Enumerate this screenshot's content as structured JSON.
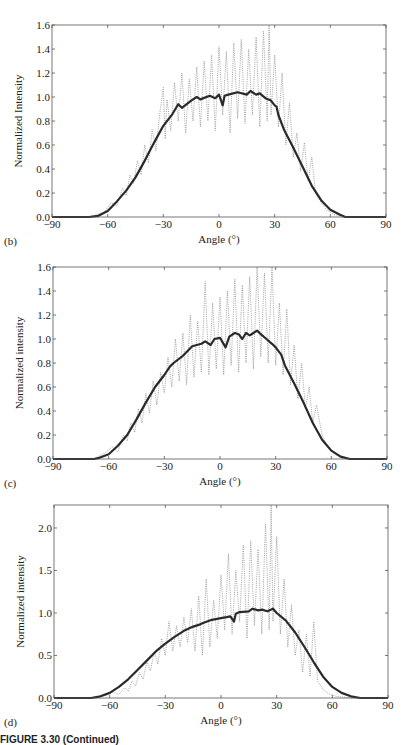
{
  "caption": "FIGURE 3.30  (Continued)",
  "chart_data": [
    {
      "type": "line",
      "panel_label": "(b)",
      "xlabel": "Angle (°)",
      "ylabel": "Normalized Intensity",
      "xlim": [
        -90,
        90
      ],
      "ylim": [
        0,
        1.6
      ],
      "xticks": [
        -90,
        -60,
        -30,
        0,
        30,
        60,
        90
      ],
      "yticks": [
        0.0,
        0.2,
        0.4,
        0.6,
        0.8,
        1.0,
        1.2,
        1.4,
        1.6
      ],
      "ytick_labels": [
        "0.0",
        "0.2",
        "0.4",
        "0.6",
        "0.8",
        "1.0",
        "1.2",
        "1.4",
        "1.6"
      ],
      "grid": false,
      "frame": {
        "left": 52,
        "top": 25,
        "right": 386,
        "bottom": 217
      },
      "series": [
        {
          "name": "smoothed",
          "style": "solid-thick",
          "x": [
            -90,
            -70,
            -65,
            -60,
            -55,
            -50,
            -45,
            -40,
            -35,
            -30,
            -25,
            -22,
            -20,
            -15,
            -12,
            -10,
            -5,
            -2,
            0,
            2,
            3,
            5,
            10,
            15,
            17,
            20,
            22,
            25,
            28,
            30,
            31,
            32,
            35,
            40,
            45,
            50,
            55,
            60,
            65,
            68,
            70,
            90
          ],
          "y": [
            0.0,
            0.0,
            0.01,
            0.05,
            0.13,
            0.22,
            0.33,
            0.47,
            0.62,
            0.76,
            0.86,
            0.94,
            0.91,
            0.97,
            1.0,
            0.98,
            1.01,
            0.99,
            1.02,
            0.93,
            1.01,
            1.02,
            1.04,
            1.02,
            1.05,
            1.02,
            1.03,
            0.99,
            0.97,
            0.93,
            0.92,
            0.85,
            0.73,
            0.58,
            0.42,
            0.26,
            0.14,
            0.06,
            0.02,
            0.0,
            0.0,
            0.0
          ]
        },
        {
          "name": "raw",
          "style": "dotted-thin",
          "x": [
            -70,
            -62,
            -58,
            -55,
            -52,
            -50,
            -48,
            -46,
            -44,
            -42,
            -40,
            -38,
            -36,
            -34,
            -32,
            -30,
            -29,
            -28,
            -26,
            -24,
            -22,
            -20,
            -18,
            -16,
            -14,
            -12,
            -10,
            -8,
            -6,
            -4,
            -2,
            0,
            2,
            4,
            6,
            8,
            10,
            12,
            14,
            16,
            18,
            20,
            22,
            24,
            26,
            27,
            28,
            30,
            32,
            34,
            36,
            38,
            40,
            42,
            44,
            46,
            48,
            50,
            52,
            55,
            58,
            62,
            66,
            70
          ],
          "y": [
            0.0,
            0.04,
            0.12,
            0.09,
            0.24,
            0.18,
            0.35,
            0.28,
            0.47,
            0.35,
            0.6,
            0.45,
            0.73,
            0.55,
            0.85,
            1.08,
            0.65,
            0.98,
            0.72,
            1.12,
            0.8,
            1.2,
            0.7,
            1.15,
            0.8,
            1.25,
            0.75,
            1.3,
            0.8,
            1.35,
            0.72,
            1.42,
            0.85,
            1.38,
            0.7,
            1.45,
            0.82,
            1.48,
            0.78,
            1.4,
            0.85,
            1.5,
            0.75,
            1.55,
            0.8,
            1.6,
            0.85,
            1.35,
            0.75,
            1.2,
            0.6,
            0.95,
            0.5,
            0.7,
            0.38,
            0.62,
            0.3,
            0.5,
            0.2,
            0.12,
            0.06,
            0.02,
            0.01,
            0.0
          ]
        }
      ]
    },
    {
      "type": "line",
      "panel_label": "(c)",
      "xlabel": "Angle (°)",
      "ylabel": "Normalized intensity",
      "xlim": [
        -90,
        90
      ],
      "ylim": [
        0,
        1.6
      ],
      "xticks": [
        -90,
        -60,
        -30,
        0,
        30,
        60,
        90
      ],
      "yticks": [
        0.0,
        0.2,
        0.4,
        0.6,
        0.8,
        1.0,
        1.2,
        1.4,
        1.6
      ],
      "ytick_labels": [
        "0.0",
        "0.2",
        "0.4",
        "0.6",
        "0.8",
        "1.0",
        "1.2",
        "1.4",
        "1.6"
      ],
      "grid": false,
      "frame": {
        "left": 53,
        "top": 267,
        "right": 387,
        "bottom": 459
      },
      "series": [
        {
          "name": "smoothed",
          "style": "solid-thick",
          "x": [
            -90,
            -68,
            -65,
            -60,
            -55,
            -50,
            -45,
            -40,
            -35,
            -30,
            -27,
            -25,
            -20,
            -15,
            -10,
            -8,
            -5,
            -3,
            0,
            3,
            5,
            8,
            10,
            12,
            14,
            16,
            18,
            20,
            22,
            25,
            28,
            30,
            33,
            35,
            40,
            45,
            50,
            55,
            60,
            65,
            70,
            90
          ],
          "y": [
            0.0,
            0.0,
            0.01,
            0.04,
            0.11,
            0.2,
            0.33,
            0.47,
            0.6,
            0.7,
            0.77,
            0.8,
            0.86,
            0.94,
            0.96,
            0.98,
            0.95,
            1.0,
            1.01,
            0.93,
            1.02,
            1.05,
            1.04,
            1.0,
            1.05,
            1.03,
            1.05,
            1.07,
            1.04,
            1.0,
            0.96,
            0.93,
            0.87,
            0.78,
            0.63,
            0.47,
            0.3,
            0.16,
            0.07,
            0.02,
            0.0,
            0.0
          ]
        },
        {
          "name": "raw",
          "style": "dotted-thin",
          "x": [
            -68,
            -62,
            -58,
            -55,
            -52,
            -50,
            -48,
            -46,
            -44,
            -42,
            -40,
            -38,
            -36,
            -34,
            -32,
            -30,
            -28,
            -26,
            -24,
            -22,
            -20,
            -18,
            -16,
            -14,
            -12,
            -10,
            -8,
            -6,
            -4,
            -2,
            0,
            2,
            4,
            6,
            8,
            10,
            12,
            14,
            16,
            18,
            20,
            22,
            24,
            26,
            28,
            30,
            32,
            34,
            36,
            38,
            40,
            42,
            44,
            46,
            48,
            50,
            52,
            55,
            58,
            62,
            66,
            70
          ],
          "y": [
            0.0,
            0.05,
            0.1,
            0.06,
            0.2,
            0.15,
            0.3,
            0.22,
            0.42,
            0.3,
            0.55,
            0.38,
            0.65,
            0.45,
            0.72,
            0.55,
            0.85,
            0.6,
            1.0,
            0.65,
            1.05,
            0.62,
            1.2,
            0.68,
            1.15,
            0.72,
            1.48,
            0.7,
            1.3,
            0.75,
            1.35,
            0.7,
            1.4,
            0.78,
            1.5,
            0.72,
            1.45,
            0.8,
            1.52,
            0.75,
            1.6,
            0.85,
            1.55,
            0.8,
            1.6,
            0.78,
            1.3,
            0.7,
            1.25,
            0.62,
            0.95,
            0.5,
            0.8,
            0.42,
            0.6,
            0.3,
            0.45,
            0.2,
            0.1,
            0.04,
            0.01,
            0.0
          ]
        }
      ]
    },
    {
      "type": "line",
      "panel_label": "(d)",
      "xlabel": "Angle (°)",
      "ylabel": "Normalized intensity",
      "xlim": [
        -90,
        90
      ],
      "ylim": [
        0,
        2.27
      ],
      "xticks": [
        -90,
        -60,
        -30,
        0,
        30,
        60,
        90
      ],
      "yticks": [
        0.0,
        0.5,
        1.0,
        1.5,
        2.0
      ],
      "ytick_labels": [
        "0.0",
        "0.5",
        "1.0",
        "1.5",
        "2.0"
      ],
      "grid": false,
      "frame": {
        "left": 54,
        "top": 505,
        "right": 388,
        "bottom": 698
      },
      "series": [
        {
          "name": "smoothed",
          "style": "solid-thick",
          "x": [
            -90,
            -70,
            -65,
            -60,
            -55,
            -50,
            -45,
            -40,
            -35,
            -30,
            -25,
            -20,
            -15,
            -12,
            -10,
            -5,
            0,
            3,
            5,
            7,
            8,
            10,
            15,
            17,
            20,
            22,
            25,
            28,
            30,
            35,
            40,
            45,
            50,
            55,
            60,
            65,
            70,
            75,
            90
          ],
          "y": [
            0.0,
            0.0,
            0.02,
            0.06,
            0.13,
            0.22,
            0.33,
            0.44,
            0.55,
            0.64,
            0.72,
            0.79,
            0.84,
            0.86,
            0.88,
            0.92,
            0.94,
            0.95,
            0.96,
            0.9,
            0.99,
            1.01,
            1.02,
            1.05,
            1.03,
            1.04,
            1.02,
            1.05,
            1.0,
            0.91,
            0.77,
            0.6,
            0.42,
            0.25,
            0.13,
            0.06,
            0.02,
            0.0,
            0.0
          ]
        },
        {
          "name": "raw",
          "style": "dotted-thin",
          "x": [
            -68,
            -62,
            -58,
            -55,
            -52,
            -50,
            -48,
            -46,
            -44,
            -42,
            -40,
            -38,
            -36,
            -34,
            -32,
            -30,
            -28,
            -26,
            -24,
            -22,
            -20,
            -18,
            -16,
            -14,
            -12,
            -10,
            -8,
            -6,
            -4,
            -2,
            0,
            2,
            4,
            6,
            8,
            10,
            12,
            14,
            16,
            18,
            20,
            22,
            24,
            26,
            27,
            28,
            30,
            32,
            34,
            36,
            38,
            40,
            42,
            44,
            46,
            48,
            50,
            52,
            55,
            58,
            62,
            66,
            72
          ],
          "y": [
            0.0,
            0.03,
            0.07,
            0.04,
            0.12,
            0.08,
            0.2,
            0.14,
            0.3,
            0.22,
            0.42,
            0.32,
            0.55,
            0.4,
            0.7,
            0.5,
            0.9,
            0.55,
            0.85,
            0.6,
            0.95,
            0.65,
            1.05,
            0.55,
            1.2,
            0.5,
            1.4,
            0.6,
            1.15,
            0.7,
            1.45,
            0.8,
            1.7,
            0.75,
            1.5,
            0.9,
            1.8,
            0.7,
            1.85,
            0.85,
            1.75,
            0.75,
            2.05,
            0.8,
            2.27,
            0.9,
            1.9,
            0.75,
            1.4,
            0.6,
            1.1,
            0.5,
            0.8,
            0.3,
            0.75,
            0.25,
            0.9,
            0.2,
            0.1,
            0.05,
            0.02,
            0.01,
            0.0
          ]
        }
      ]
    }
  ]
}
